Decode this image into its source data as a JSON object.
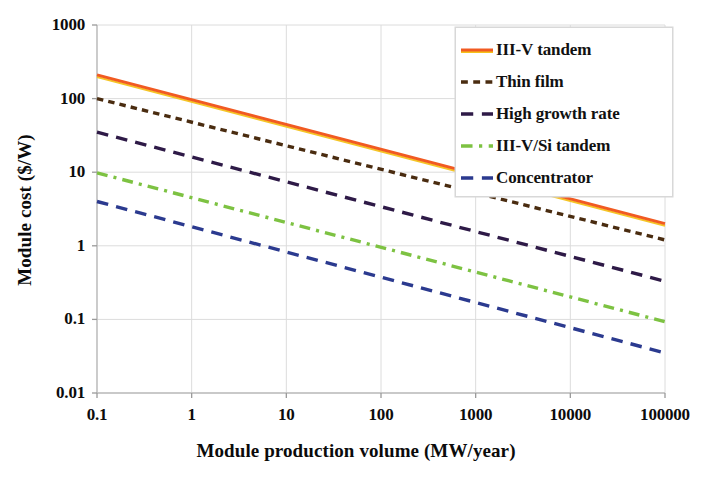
{
  "chart_data": {
    "type": "line",
    "title": "",
    "xlabel": "Module production volume (MW/year)",
    "ylabel": "Module cost ($/W)",
    "xscale": "log",
    "yscale": "log",
    "xlim": [
      0.1,
      100000
    ],
    "ylim": [
      0.01,
      1000
    ],
    "xticks": [
      "0.1",
      "1",
      "10",
      "100",
      "1000",
      "10000",
      "100000"
    ],
    "xtick_values": [
      0.1,
      1,
      10,
      100,
      1000,
      10000,
      100000
    ],
    "yticks": [
      "1000",
      "100",
      "10",
      "1",
      "0.1",
      "0.01"
    ],
    "ytick_values": [
      1000,
      100,
      10,
      1,
      0.1,
      0.01
    ],
    "grid": true,
    "legend_position": "upper right",
    "series": [
      {
        "name": "III-V tandem",
        "color": "#F15A22",
        "style": "solid",
        "x": [
          0.1,
          100000
        ],
        "y": [
          210,
          2.0
        ]
      },
      {
        "name": "Thin film",
        "color": "#4A2C10",
        "style": "dotted",
        "x": [
          0.1,
          100000
        ],
        "y": [
          100,
          1.2
        ]
      },
      {
        "name": "High growth rate",
        "color": "#2E1A47",
        "style": "dashed",
        "x": [
          0.1,
          100000
        ],
        "y": [
          35,
          0.33
        ]
      },
      {
        "name": "III-V/Si tandem",
        "color": "#7DC242",
        "style": "dash-dot",
        "x": [
          0.1,
          100000
        ],
        "y": [
          9.8,
          0.093
        ]
      },
      {
        "name": "Concentrator",
        "color": "#2B3A8F",
        "style": "dashed",
        "x": [
          0.1,
          100000
        ],
        "y": [
          4.0,
          0.035
        ]
      }
    ]
  },
  "axes": {
    "xlabel": "Module production volume (MW/year)",
    "ylabel": "Module cost ($/W)",
    "xticks": [
      "0.1",
      "1",
      "10",
      "100",
      "1000",
      "10000",
      "100000"
    ],
    "yticks": [
      "1000",
      "100",
      "10",
      "1",
      "0.1",
      "0.01"
    ]
  },
  "legend": {
    "items": [
      {
        "label": "III-V tandem",
        "color": "#F15A22",
        "style": "solid"
      },
      {
        "label": "Thin film",
        "color": "#4A2C10",
        "style": "dotted"
      },
      {
        "label": "High growth rate",
        "color": "#2E1A47",
        "style": "dashed"
      },
      {
        "label": "III-V/Si tandem",
        "color": "#7DC242",
        "style": "dash-dot"
      },
      {
        "label": "Concentrator",
        "color": "#2B3A8F",
        "style": "dashed"
      }
    ]
  }
}
